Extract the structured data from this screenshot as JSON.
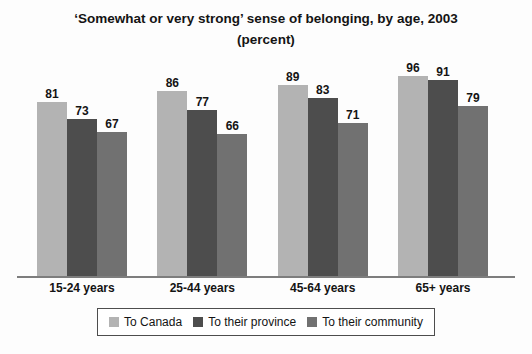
{
  "chart_data": {
    "type": "bar",
    "title": "‘Somewhat or very strong’ sense of belonging, by age, 2003",
    "subtitle": "(percent)",
    "categories": [
      "15-24 years",
      "25-44 years",
      "45-64 years",
      "65+ years"
    ],
    "series": [
      {
        "name": "To Canada",
        "color": "#b3b3b3",
        "values": [
          81,
          86,
          89,
          96
        ]
      },
      {
        "name": "To their province",
        "color": "#4d4d4d",
        "values": [
          73,
          77,
          83,
          91
        ]
      },
      {
        "name": "To their community",
        "color": "#717171",
        "values": [
          67,
          66,
          71,
          79
        ]
      }
    ],
    "ylim": [
      0,
      100
    ],
    "grid": false,
    "y_axis_visible": false,
    "data_labels": true,
    "legend_position": "bottom",
    "axis_line_color": "#7d7d7d",
    "text_color": "#141414"
  }
}
